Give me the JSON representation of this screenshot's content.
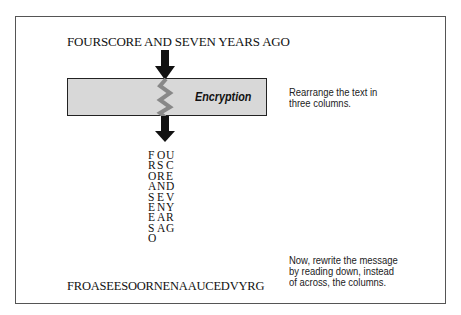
{
  "diagram": {
    "plaintext": "FOURSCORE AND SEVEN YEARS AGO",
    "process_label": "Encryption",
    "step1_note": [
      "Rearrange the text in",
      "three columns."
    ],
    "grid_rows": [
      [
        "F",
        "O",
        "U"
      ],
      [
        "R",
        "S",
        "C"
      ],
      [
        "O",
        "R",
        "E"
      ],
      [
        "A",
        "N",
        "D"
      ],
      [
        "S",
        "E",
        "V"
      ],
      [
        "E",
        "N",
        "Y"
      ],
      [
        "E",
        "A",
        "R"
      ],
      [
        "S",
        "A",
        "G"
      ],
      [
        "O",
        "",
        ""
      ]
    ],
    "ciphertext": "FROASEESOORNENAAUCEDVYRG",
    "step2_note": [
      "Now, rewrite the message",
      "by reading down, instead",
      "of across, the columns."
    ],
    "colors": {
      "box_fill": "#d8d8d8",
      "zigzag": "#888888",
      "arrow": "#111111",
      "border": "#555555"
    }
  }
}
